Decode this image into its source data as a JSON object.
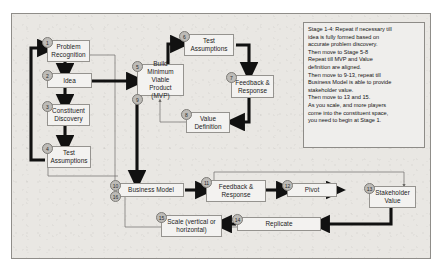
{
  "diagram": {
    "frame_color": "#e9e7e3",
    "node_fill": "#f3f2f0",
    "badge_fill": "#bdbbb7",
    "thick_arrow_color": "#111111",
    "thin_line_color": "#6d6b67"
  },
  "nodes": [
    {
      "number": "1",
      "label": "Problem Recognition",
      "lines": [
        "Problem",
        "Recognition"
      ]
    },
    {
      "number": "2",
      "label": "Idea",
      "lines": [
        "Idea"
      ]
    },
    {
      "number": "3",
      "label": "Constituent Discovery",
      "lines": [
        "Constituent",
        "Discovery"
      ]
    },
    {
      "number": "4",
      "label": "Test Assumptions",
      "lines": [
        "Test",
        "Assumptions"
      ]
    },
    {
      "number": "5",
      "label": "Build Minimum Viable Product (MVP)",
      "lines": [
        "Build Minimum",
        "Viable Product",
        "(MVP)"
      ]
    },
    {
      "number": "6",
      "label": "Test Assumptions",
      "lines": [
        "Test",
        "Assumptions"
      ]
    },
    {
      "number": "7",
      "label": "Feedback & Response",
      "lines": [
        "Feedback &",
        "Response"
      ]
    },
    {
      "number": "8",
      "label": "Value Definition",
      "lines": [
        "Value",
        "Definition"
      ]
    },
    {
      "number": "9",
      "label": "",
      "lines": []
    },
    {
      "number": "10",
      "label": "Business Model",
      "lines": [
        "Business Model"
      ]
    },
    {
      "number": "11",
      "label": "Feedback & Response",
      "lines": [
        "Feedback &",
        "Response"
      ]
    },
    {
      "number": "12",
      "label": "Pivot",
      "lines": [
        "Pivot"
      ]
    },
    {
      "number": "13",
      "label": "Stakeholder Value",
      "lines": [
        "Stakeholder",
        "Value"
      ]
    },
    {
      "number": "14",
      "label": "Replicate",
      "lines": [
        "Replicate"
      ]
    },
    {
      "number": "15",
      "label": "Scale (vertical or horizontal)",
      "lines": [
        "Scale (vertical or",
        "horizontal)"
      ]
    },
    {
      "number": "16",
      "label": "",
      "lines": []
    }
  ],
  "note": {
    "lines": [
      "Stage 1-4: Repeat if necessary till",
      "idea is fully formed based on",
      "accurate problem discovery.",
      "Then move to Stage 5-8",
      "Repeat till MVP and Value",
      "definition are aligned.",
      "Then move to 9-13, repeat till",
      "Business Model is able to provide",
      "stakeholder value.",
      "Then move to 13 and 15.",
      "As you scale, and more players",
      "come into the constituent space,",
      "you need to begin at Stage 1."
    ]
  }
}
